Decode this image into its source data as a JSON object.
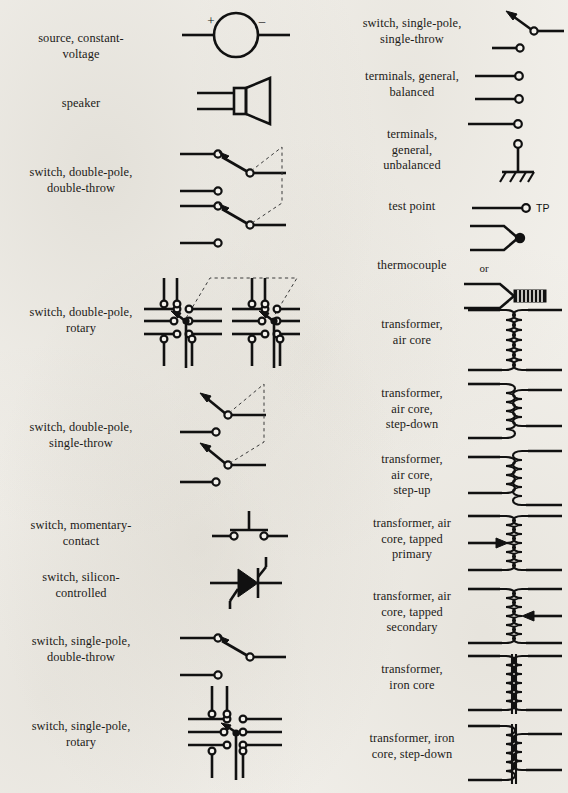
{
  "page": {
    "background_color": "#f3f1ec",
    "ink_color": "#111111",
    "columns": 2
  },
  "left_column": {
    "entries": [
      {
        "label": "source, constant-\nvoltage",
        "symbol": "voltage-source",
        "plus": "+",
        "minus": "−"
      },
      {
        "label": "speaker",
        "symbol": "speaker"
      },
      {
        "label": "switch, double-pole,\ndouble-throw",
        "symbol": "switch-dpdt"
      },
      {
        "label": "switch, double-pole,\nrotary",
        "symbol": "switch-dp-rotary"
      },
      {
        "label": "switch, double-pole,\nsingle-throw",
        "symbol": "switch-dpst"
      },
      {
        "label": "switch, momentary-\ncontact",
        "symbol": "switch-momentary"
      },
      {
        "label": "switch, silicon-\ncontrolled",
        "symbol": "switch-scr"
      },
      {
        "label": "switch, single-pole,\ndouble-throw",
        "symbol": "switch-spdt"
      },
      {
        "label": "switch, single-pole,\nrotary",
        "symbol": "switch-sp-rotary"
      }
    ]
  },
  "right_column": {
    "entries": [
      {
        "label": "switch, single-pole,\nsingle-throw",
        "symbol": "switch-spst"
      },
      {
        "label": "terminals, general,\nbalanced",
        "symbol": "terminals-balanced"
      },
      {
        "label": "terminals,\ngeneral,\nunbalanced",
        "symbol": "terminals-unbalanced"
      },
      {
        "label": "test point",
        "symbol": "test-point",
        "annotation": "TP"
      },
      {
        "label": "thermocouple",
        "symbol": "thermocouple",
        "annotation": "or"
      },
      {
        "label": "transformer,\nair core",
        "symbol": "transformer-air-core"
      },
      {
        "label": "transformer,\nair core,\nstep-down",
        "symbol": "transformer-air-step-down"
      },
      {
        "label": "transformer,\nair core,\nstep-up",
        "symbol": "transformer-air-step-up"
      },
      {
        "label": "transformer, air\ncore, tapped\nprimary",
        "symbol": "transformer-air-tapped-primary"
      },
      {
        "label": "transformer, air\ncore, tapped\nsecondary",
        "symbol": "transformer-air-tapped-secondary"
      },
      {
        "label": "transformer,\niron core",
        "symbol": "transformer-iron-core"
      },
      {
        "label": "transformer, iron\ncore, step-down",
        "symbol": "transformer-iron-step-down"
      }
    ]
  }
}
